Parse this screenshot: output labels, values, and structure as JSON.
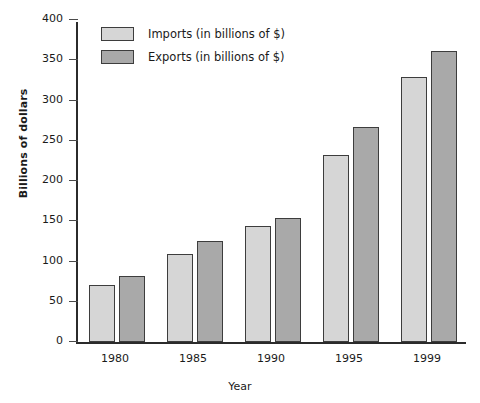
{
  "chart_data": {
    "type": "bar",
    "title": "",
    "xlabel": "Year",
    "ylabel": "Billions of dollars",
    "categories": [
      "1980",
      "1985",
      "1990",
      "1995",
      "1999"
    ],
    "series": [
      {
        "name": "Imports (in billions of $)",
        "color": "#d6d6d6",
        "values": [
          71,
          109,
          144,
          232,
          329
        ]
      },
      {
        "name": "Exports (in billions of $)",
        "color": "#a9a9a9",
        "values": [
          82,
          125,
          154,
          267,
          362
        ]
      }
    ],
    "ylim": [
      0,
      400
    ],
    "ytick_values": [
      0,
      50,
      100,
      150,
      200,
      250,
      300,
      350,
      400
    ],
    "ytick_labels": [
      "0",
      "50",
      "100",
      "150",
      "200",
      "250",
      "300",
      "350",
      "400"
    ],
    "grid": false,
    "legend_position": "top-left"
  },
  "legend": {
    "items": [
      {
        "label": "Imports (in billions of $)"
      },
      {
        "label": "Exports (in billions of $)"
      }
    ]
  },
  "axes": {
    "y_title": "Billions of dollars",
    "x_title": "Year"
  }
}
